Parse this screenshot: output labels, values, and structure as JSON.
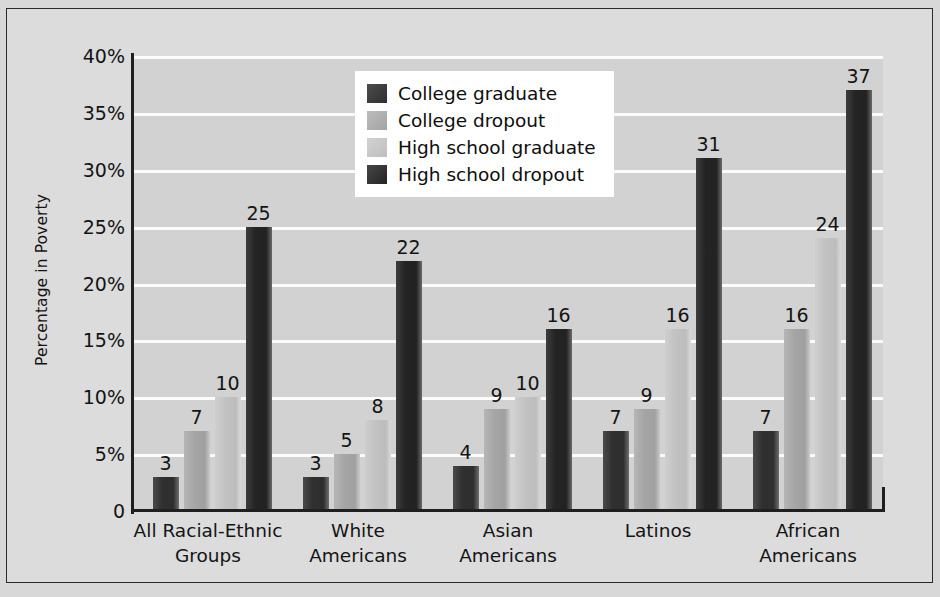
{
  "chart_data": {
    "type": "bar",
    "title": "",
    "xlabel": "",
    "ylabel": "Percentage in Poverty",
    "ylim": [
      0,
      40
    ],
    "grid": true,
    "legend_position": "top-center",
    "categories": [
      "All Racial-Ethnic Groups",
      "White Americans",
      "Asian Americans",
      "Latinos",
      "African Americans"
    ],
    "category_lines": [
      [
        "All Racial-Ethnic",
        "Groups"
      ],
      [
        "White",
        "Americans"
      ],
      [
        "Asian",
        "Americans"
      ],
      [
        "Latinos",
        ""
      ],
      [
        "African",
        "Americans"
      ]
    ],
    "series": [
      {
        "name": "College graduate",
        "color": "#2f2f2f",
        "values": [
          3,
          3,
          4,
          7,
          7
        ]
      },
      {
        "name": "College dropout",
        "color": "#a5a5a5",
        "values": [
          7,
          5,
          9,
          9,
          16
        ]
      },
      {
        "name": "High school graduate",
        "color": "#c2c2c2",
        "values": [
          10,
          8,
          10,
          16,
          24
        ]
      },
      {
        "name": "High school dropout",
        "color": "#242424",
        "values": [
          25,
          22,
          16,
          31,
          37
        ]
      }
    ],
    "ytick_labels": [
      "40%",
      "35%",
      "30%",
      "25%",
      "20%",
      "15%",
      "10%",
      "5%",
      "0"
    ],
    "ytick_values": [
      40,
      35,
      30,
      25,
      20,
      15,
      10,
      5,
      0
    ]
  },
  "colors": {
    "plot_background": "#d2d2d2",
    "figure_background": "#dcdcdc",
    "gridline": "#fbfbfb",
    "axis": "#1f1f1f",
    "text": "#141414",
    "legend_background": "#ffffff"
  }
}
